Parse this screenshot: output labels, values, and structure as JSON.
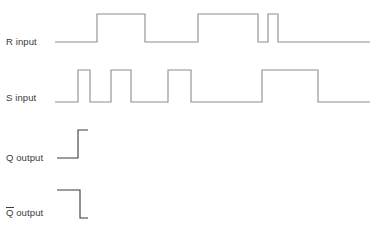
{
  "figure": {
    "kind": "digital-timing-diagram",
    "width": 370,
    "height": 228,
    "background_color": "#ffffff",
    "trace_color": "#8d8d8d",
    "output_trace_color": "#3a3a3a",
    "label_color": "#3a3a3a"
  },
  "signals": [
    {
      "id": "r-input",
      "label": "R input",
      "label_has_overbar": false,
      "label_x": 6,
      "label_baseline_y": 46,
      "trace_color": "#8d8d8d",
      "low_y": 42,
      "high_y": 14,
      "x_start": 55,
      "x_end": 370,
      "initial_level": "low",
      "final_level": "low",
      "pulses": [
        {
          "start": 97,
          "end": 145
        },
        {
          "start": 198,
          "end": 258
        },
        {
          "start": 268,
          "end": 278
        }
      ]
    },
    {
      "id": "s-input",
      "label": "S input",
      "label_has_overbar": false,
      "label_x": 6,
      "label_baseline_y": 102,
      "trace_color": "#8d8d8d",
      "low_y": 102,
      "high_y": 70,
      "x_start": 55,
      "x_end": 370,
      "initial_level": "low",
      "final_level": "low",
      "pulses": [
        {
          "start": 78,
          "end": 90
        },
        {
          "start": 111,
          "end": 131
        },
        {
          "start": 168,
          "end": 191
        },
        {
          "start": 262,
          "end": 318
        }
      ]
    },
    {
      "id": "q-output",
      "label": "Q output",
      "label_has_overbar": false,
      "label_x": 6,
      "label_baseline_y": 162,
      "trace_color": "#3a3a3a",
      "low_y": 158,
      "high_y": 130,
      "x_start": 57,
      "x_end": 88,
      "initial_level": "low",
      "final_level": "high",
      "transitions": [
        {
          "x": 78,
          "to": "high"
        }
      ]
    },
    {
      "id": "qbar-output",
      "label": "Q output",
      "label_symbol": "Q",
      "label_suffix": " output",
      "label_has_overbar": true,
      "label_x": 6,
      "label_baseline_y": 216,
      "trace_color": "#3a3a3a",
      "low_y": 218,
      "high_y": 190,
      "x_start": 57,
      "x_end": 88,
      "initial_level": "high",
      "final_level": "low",
      "transitions": [
        {
          "x": 80,
          "to": "low"
        }
      ]
    }
  ],
  "chart_data": {
    "type": "line",
    "title": "",
    "xlabel": "",
    "ylabel": "",
    "grid": false,
    "legend": "none",
    "series": [
      {
        "name": "R input",
        "levels": [
          0,
          1,
          0,
          1,
          0,
          1,
          0
        ]
      },
      {
        "name": "S input",
        "levels": [
          0,
          1,
          0,
          1,
          0,
          1,
          0,
          1,
          0
        ]
      },
      {
        "name": "Q output",
        "levels": [
          0,
          1
        ]
      },
      {
        "name": "Q̅ output",
        "levels": [
          1,
          0
        ]
      }
    ]
  }
}
